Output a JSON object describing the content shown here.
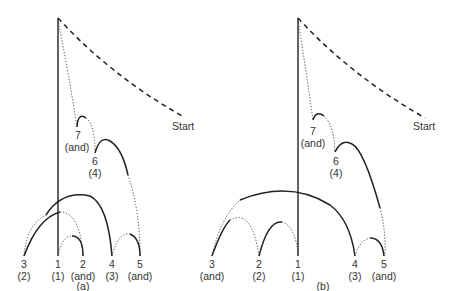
{
  "diagrams": [
    {
      "caption": "(a)",
      "start_label": "Start",
      "nodes": [
        {
          "id": "7",
          "sub": "(and)"
        },
        {
          "id": "6",
          "sub": "(4)"
        },
        {
          "id": "3",
          "sub": "(2)"
        },
        {
          "id": "1",
          "sub": "(1)"
        },
        {
          "id": "2",
          "sub": "(and)"
        },
        {
          "id": "4",
          "sub": "(3)"
        },
        {
          "id": "5",
          "sub": "(and)"
        }
      ]
    },
    {
      "caption": "(b)",
      "start_label": "Start",
      "nodes": [
        {
          "id": "7",
          "sub": "(and)"
        },
        {
          "id": "6",
          "sub": "(4)"
        },
        {
          "id": "3",
          "sub": "(and)"
        },
        {
          "id": "2",
          "sub": "(2)"
        },
        {
          "id": "1",
          "sub": "(1)"
        },
        {
          "id": "4",
          "sub": "(3)"
        },
        {
          "id": "5",
          "sub": "(and)"
        }
      ]
    }
  ],
  "legend_styles": {
    "solid": "solid arc",
    "dotted": "dotted arc",
    "dashed": "dashed path to Start"
  }
}
